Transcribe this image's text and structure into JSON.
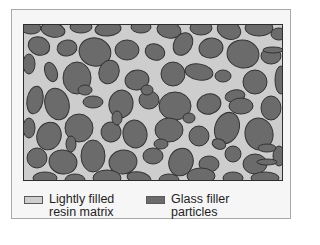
{
  "figure": {
    "colors": {
      "matrix": "#cdcdcd",
      "particle": "#6b6b6b",
      "particle_outline": "#333333",
      "frame_bg": "#f6f6f6"
    },
    "particles": [
      [
        8,
        4,
        10,
        6,
        0
      ],
      [
        30,
        6,
        12,
        7,
        10
      ],
      [
        58,
        3,
        11,
        6,
        0
      ],
      [
        85,
        5,
        13,
        7,
        -5
      ],
      [
        118,
        3,
        10,
        6,
        0
      ],
      [
        146,
        6,
        12,
        8,
        10
      ],
      [
        178,
        4,
        11,
        7,
        0
      ],
      [
        206,
        6,
        12,
        9,
        20
      ],
      [
        236,
        4,
        14,
        8,
        0
      ],
      [
        256,
        10,
        8,
        6,
        0
      ],
      [
        16,
        22,
        11,
        9,
        20
      ],
      [
        44,
        24,
        10,
        8,
        -10
      ],
      [
        72,
        28,
        16,
        14,
        15
      ],
      [
        104,
        26,
        12,
        10,
        0
      ],
      [
        132,
        28,
        10,
        8,
        20
      ],
      [
        160,
        20,
        9,
        12,
        30
      ],
      [
        188,
        24,
        12,
        10,
        -10
      ],
      [
        220,
        30,
        16,
        14,
        10
      ],
      [
        248,
        32,
        10,
        8,
        0
      ],
      [
        6,
        40,
        6,
        10,
        0
      ],
      [
        28,
        48,
        6,
        10,
        -20
      ],
      [
        54,
        54,
        14,
        16,
        0
      ],
      [
        86,
        48,
        10,
        12,
        20
      ],
      [
        114,
        56,
        12,
        10,
        -10
      ],
      [
        150,
        50,
        12,
        12,
        0
      ],
      [
        176,
        48,
        14,
        8,
        10
      ],
      [
        200,
        52,
        8,
        6,
        0
      ],
      [
        232,
        58,
        12,
        12,
        0
      ],
      [
        258,
        56,
        6,
        14,
        0
      ],
      [
        12,
        76,
        8,
        14,
        10
      ],
      [
        34,
        80,
        12,
        16,
        -15
      ],
      [
        70,
        78,
        10,
        6,
        0
      ],
      [
        98,
        80,
        12,
        14,
        10
      ],
      [
        126,
        76,
        10,
        9,
        0
      ],
      [
        152,
        82,
        16,
        14,
        0
      ],
      [
        186,
        80,
        12,
        10,
        -15
      ],
      [
        212,
        72,
        10,
        6,
        -10
      ],
      [
        218,
        82,
        12,
        8,
        0
      ],
      [
        248,
        84,
        10,
        12,
        0
      ],
      [
        6,
        104,
        6,
        10,
        0
      ],
      [
        26,
        112,
        12,
        14,
        20
      ],
      [
        56,
        104,
        14,
        14,
        0
      ],
      [
        88,
        108,
        10,
        10,
        10
      ],
      [
        112,
        110,
        12,
        14,
        -10
      ],
      [
        146,
        106,
        14,
        12,
        0
      ],
      [
        176,
        112,
        10,
        10,
        0
      ],
      [
        204,
        104,
        12,
        16,
        20
      ],
      [
        236,
        110,
        14,
        16,
        -10
      ],
      [
        14,
        134,
        10,
        10,
        0
      ],
      [
        40,
        138,
        14,
        12,
        10
      ],
      [
        70,
        132,
        12,
        16,
        0
      ],
      [
        100,
        138,
        14,
        12,
        -10
      ],
      [
        130,
        132,
        10,
        8,
        0
      ],
      [
        158,
        138,
        12,
        14,
        20
      ],
      [
        186,
        140,
        10,
        8,
        0
      ],
      [
        210,
        130,
        8,
        8,
        0
      ],
      [
        232,
        140,
        12,
        10,
        0
      ],
      [
        256,
        132,
        6,
        10,
        0
      ],
      [
        22,
        154,
        12,
        6,
        0
      ],
      [
        52,
        156,
        10,
        6,
        0
      ],
      [
        84,
        154,
        14,
        8,
        0
      ],
      [
        116,
        154,
        12,
        6,
        10
      ],
      [
        146,
        156,
        10,
        6,
        0
      ],
      [
        178,
        152,
        14,
        8,
        0
      ],
      [
        210,
        154,
        10,
        6,
        0
      ],
      [
        242,
        154,
        14,
        6,
        0
      ],
      [
        62,
        66,
        7,
        5,
        0
      ],
      [
        124,
        66,
        6,
        5,
        0
      ],
      [
        94,
        94,
        5,
        7,
        0
      ],
      [
        166,
        94,
        6,
        5,
        0
      ],
      [
        196,
        120,
        7,
        5,
        20
      ],
      [
        48,
        120,
        5,
        8,
        0
      ],
      [
        138,
        120,
        7,
        5,
        0
      ],
      [
        244,
        124,
        9,
        4,
        0
      ],
      [
        244,
        138,
        10,
        3,
        0
      ],
      [
        250,
        26,
        10,
        3,
        0
      ]
    ]
  },
  "legend": {
    "items": [
      {
        "label_line1": "Lightly filled",
        "label_line2": "resin matrix",
        "swatch_color": "#cfcfcf"
      },
      {
        "label_line1": "Glass filler",
        "label_line2": "particles",
        "swatch_color": "#6b6b6b"
      }
    ]
  }
}
